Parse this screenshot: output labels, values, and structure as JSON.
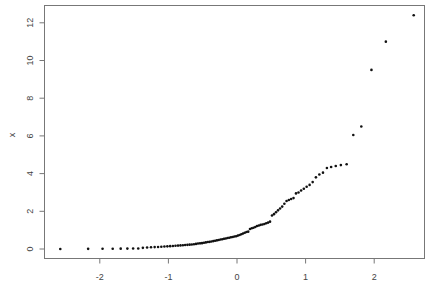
{
  "chart_data": {
    "type": "scatter",
    "title": "",
    "xlabel": "",
    "ylabel": "x",
    "xlim": [
      -2.7,
      2.7
    ],
    "ylim": [
      -0.3,
      12.8
    ],
    "xticks": [
      -2,
      -1,
      0,
      1,
      2
    ],
    "xtick_labels": [
      "-2",
      "-1",
      "0",
      "1",
      "2"
    ],
    "yticks": [
      0,
      2,
      4,
      6,
      8,
      10,
      12
    ],
    "ytick_labels": [
      "0",
      "2",
      "4",
      "6",
      "8",
      "10",
      "12"
    ],
    "grid": false,
    "legend": "none",
    "point_color": "#111111",
    "n": 100,
    "x_description": "theoretical normal quantiles of p=(i-0.5)/n",
    "y": [
      0.03,
      0.06,
      0.08,
      0.09,
      0.1,
      0.11,
      0.12,
      0.13,
      0.14,
      0.15,
      0.16,
      0.17,
      0.18,
      0.19,
      0.2,
      0.21,
      0.22,
      0.23,
      0.24,
      0.25,
      0.27,
      0.29,
      0.3,
      0.31,
      0.33,
      0.35,
      0.37,
      0.38,
      0.4,
      0.42,
      0.44,
      0.46,
      0.48,
      0.5,
      0.52,
      0.54,
      0.56,
      0.58,
      0.6,
      0.62,
      0.64,
      0.66,
      0.68,
      0.71,
      0.74,
      0.78,
      0.82,
      0.86,
      0.9,
      0.92,
      1.06,
      1.1,
      1.13,
      1.17,
      1.22,
      1.25,
      1.28,
      1.3,
      1.33,
      1.37,
      1.4,
      1.45,
      1.78,
      1.85,
      1.95,
      2.05,
      2.15,
      2.25,
      2.4,
      2.55,
      2.6,
      2.65,
      2.7,
      2.95,
      3.0,
      3.1,
      3.2,
      3.3,
      3.4,
      3.55,
      3.8,
      3.95,
      4.05,
      4.3,
      4.35,
      4.4,
      4.45,
      4.5,
      6.05,
      6.5,
      9.5,
      11.0,
      12.4
    ]
  }
}
